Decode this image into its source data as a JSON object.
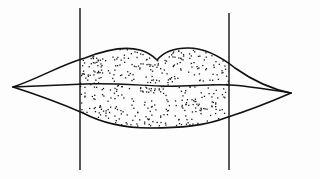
{
  "diagram": {
    "colors": {
      "ink": "#111111",
      "background": "#fdfdfd",
      "stipple": "#1a1a1a"
    },
    "parts": [
      {
        "id": "upper-lip",
        "label": ""
      },
      {
        "id": "lower-lip",
        "label": ""
      },
      {
        "id": "lip-parting-line",
        "label": ""
      },
      {
        "id": "left-boundary-line",
        "label": ""
      },
      {
        "id": "right-boundary-line",
        "label": ""
      },
      {
        "id": "stippled-region",
        "label": ""
      }
    ]
  }
}
